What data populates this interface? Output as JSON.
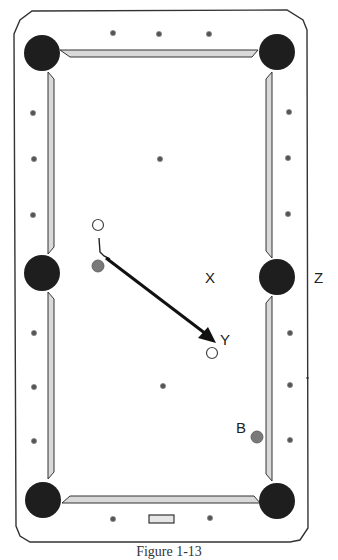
{
  "diagram": {
    "type": "pool-table-shot-diagram",
    "table": {
      "frame_color": "#333333",
      "rail_color": "#d8d8d8",
      "pocket_color": "#1e1e1e",
      "pockets": [
        {
          "name": "top-left",
          "cx": 42,
          "cy": 53
        },
        {
          "name": "top-right",
          "cx": 277,
          "cy": 52
        },
        {
          "name": "side-left",
          "cx": 42,
          "cy": 273
        },
        {
          "name": "side-right",
          "cx": 277,
          "cy": 277
        },
        {
          "name": "bottom-left",
          "cx": 43,
          "cy": 500
        },
        {
          "name": "bottom-right",
          "cx": 277,
          "cy": 501
        }
      ],
      "diamonds": {
        "top": [
          113,
          159,
          209
        ],
        "bottom": [
          113,
          210
        ],
        "left": [
          112,
          159,
          215,
          333,
          387,
          440
        ],
        "right": [
          112,
          159,
          215,
          333,
          387,
          440
        ],
        "spots": [
          {
            "cx": 160,
            "cy": 160
          },
          {
            "cx": 163,
            "cy": 385
          }
        ]
      }
    },
    "balls": [
      {
        "name": "cue-ball-start",
        "type": "white",
        "cx": 98,
        "cy": 225
      },
      {
        "name": "object-ball",
        "type": "gray",
        "cx": 98,
        "cy": 266
      },
      {
        "name": "cue-ball-end",
        "type": "white",
        "cx": 212,
        "cy": 353
      },
      {
        "name": "ball-b",
        "type": "gray",
        "cx": 257,
        "cy": 437
      }
    ],
    "arrow": {
      "x1": 104,
      "y1": 261,
      "x2": 215,
      "y2": 344
    },
    "labels": {
      "x": "X",
      "y": "Y",
      "z": "Z",
      "b": "B"
    },
    "caption": "Figure 1-13"
  }
}
